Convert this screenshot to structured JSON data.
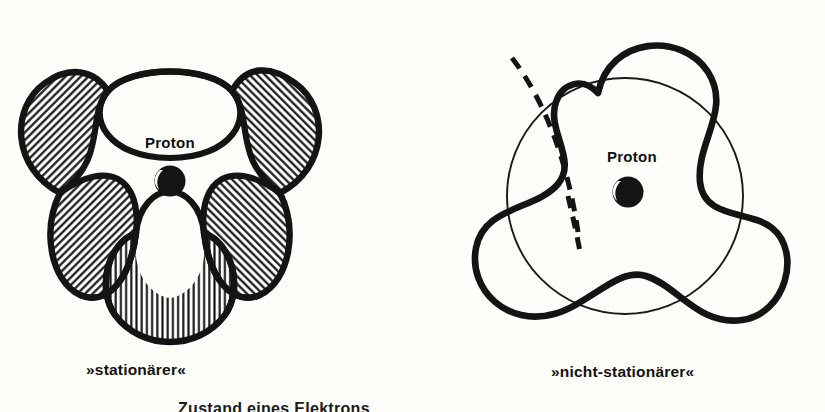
{
  "page": {
    "background_color": "#fdfdfa",
    "ink_color": "#141414",
    "width": 825,
    "height": 412
  },
  "figures": [
    {
      "id": "stationary",
      "caption": "»stationärer«",
      "nucleus_label": "Proton",
      "nucleus_type": "proton-dot",
      "outline_style": "thick-solid",
      "hatched": true,
      "lobe_count": 6,
      "hatch_patterns": [
        "diagonal-backslash",
        "vertical",
        "diagonal-slash",
        "diagonal-slash",
        "vertical",
        "diagonal-backslash"
      ],
      "has_reference_circle": false,
      "has_dashed_line": false
    },
    {
      "id": "non-stationary",
      "caption": "»nicht-stationärer«",
      "nucleus_label": "Proton",
      "nucleus_type": "proton-dot",
      "outline_style": "thick-solid",
      "hatched": false,
      "lobe_count": 3,
      "hatch_patterns": [],
      "has_reference_circle": true,
      "has_dashed_line": true
    }
  ],
  "caption_bottom": "Zustand eines             Elektrons",
  "colors": {
    "ink": "#141414",
    "paper": "#fdfdfa",
    "thin_line": "#1a1a1a"
  }
}
